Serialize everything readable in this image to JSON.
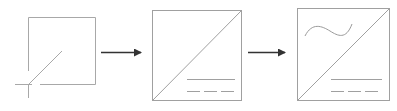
{
  "diagram": {
    "title": "",
    "stages": [
      {
        "id": "stage-1",
        "description": "open square with diagonal crossing at lower-left corner"
      },
      {
        "id": "stage-2",
        "description": "square with full diagonal and solid + dashed lines"
      },
      {
        "id": "stage-3",
        "description": "square with full diagonal, wave curve, solid + dashed lines"
      }
    ],
    "arrows": [
      {
        "from": "stage-1",
        "to": "stage-2"
      },
      {
        "from": "stage-2",
        "to": "stage-3"
      }
    ],
    "colors": {
      "stroke": "#9a9a9a",
      "arrow": "#333333",
      "background": "#ffffff"
    }
  }
}
